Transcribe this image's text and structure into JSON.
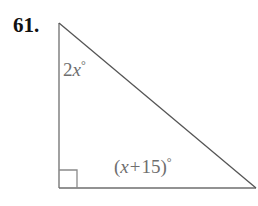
{
  "figure": {
    "problem_number": "61.",
    "shape": "right-triangle",
    "background_color": "#ffffff",
    "stroke_color": "#6e6e6e",
    "hypotenuse_color": "#555555",
    "label_color": "#6e6e6e",
    "number_color": "#111111",
    "vertices": {
      "top": [
        59,
        23
      ],
      "bottom_left": [
        59,
        188
      ],
      "bottom_right": [
        255,
        188
      ]
    },
    "right_angle_marker": {
      "corner": "bottom-left",
      "size": 18
    },
    "labels": {
      "left_angle": {
        "coefficient": "2",
        "variable": "x",
        "degree": "°",
        "full_text": "2x°"
      },
      "bottom_angle": {
        "open_paren": "(",
        "variable": "x",
        "operator": "+",
        "constant": "15",
        "close_paren": ")",
        "degree": "°",
        "full_text": "(x + 15)°"
      }
    }
  }
}
